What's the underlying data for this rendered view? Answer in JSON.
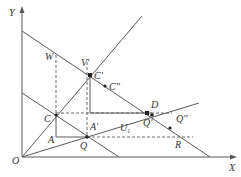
{
  "diagram": {
    "type": "economics-indifference-budget-geometry",
    "axes": {
      "y_label": "Y",
      "x_label": "X",
      "origin_label": "O"
    },
    "point_labels": {
      "W": "W",
      "V1": "V'",
      "C1": "C'",
      "C2": "C''",
      "C": "C",
      "A1": "A'",
      "D": "D",
      "Q1": "Q'",
      "Q2": "Q''",
      "U1": "U",
      "U1_sub": "1",
      "A": "A",
      "Q": "Q",
      "R": "R"
    },
    "colors": {
      "line": "#5a5a5a",
      "point": "#222222",
      "text": "#333333",
      "background": "#ffffff"
    }
  }
}
